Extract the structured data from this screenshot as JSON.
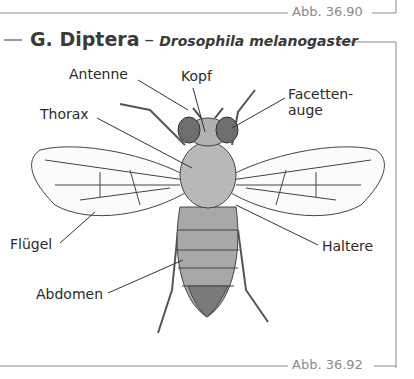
{
  "top_caption": "Abb. 36.90",
  "figure": {
    "title": "G. Diptera",
    "dash": "–",
    "species": "Drosophila melanogaster",
    "caption": "Abb. 36.92"
  },
  "labels": {
    "antenne": "Antenne",
    "kopf": "Kopf",
    "facettenauge_1": "Facetten-",
    "facettenauge_2": "auge",
    "thorax": "Thorax",
    "fluegel": "Flügel",
    "haltere": "Haltere",
    "abdomen": "Abdomen"
  },
  "colors": {
    "frame": "#8a8a8a",
    "ink": "#333333",
    "body_fill": "#a9a9a9",
    "eye_fill": "#6e6e6e"
  }
}
